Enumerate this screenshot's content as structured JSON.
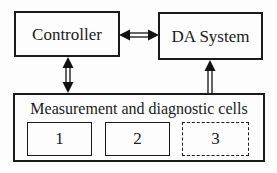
{
  "diagram": {
    "controller": {
      "label": "Controller"
    },
    "da_system": {
      "label": "DA System"
    },
    "cells_block": {
      "title": "Measurement and diagnostic cells",
      "cells": [
        {
          "label": "1",
          "border": "solid"
        },
        {
          "label": "2",
          "border": "solid"
        },
        {
          "label": "3",
          "border": "dashed"
        }
      ]
    },
    "arrows": [
      {
        "name": "controller-dasystem",
        "type": "double-headed-horizontal",
        "shaft": "double-line"
      },
      {
        "name": "controller-cells",
        "type": "double-headed-vertical",
        "shaft": "double-line"
      },
      {
        "name": "cells-dasystem",
        "type": "single-headed-up",
        "shaft": "double-line"
      }
    ],
    "colors": {
      "line": "#111111",
      "border": "#1a1a1a",
      "text": "#1a1a1a",
      "background": "#fdfdfd"
    }
  }
}
